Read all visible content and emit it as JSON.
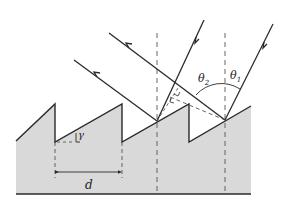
{
  "figure": {
    "labels": {
      "gamma": "γ",
      "period": "d",
      "theta1": "θ",
      "theta1_sub": "1",
      "theta2": "θ",
      "theta2_sub": "2"
    },
    "colors": {
      "substrate_fill": "#d9d9d9",
      "line": "#2a2a2a",
      "dashed": "#555555",
      "background": "#ffffff"
    }
  }
}
